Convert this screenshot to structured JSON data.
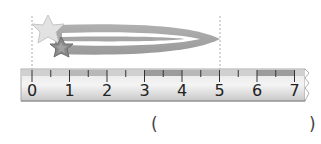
{
  "figure": {
    "object": "hair-clip-with-stars",
    "object_start": 0,
    "object_end": 5,
    "guide_lines": [
      0,
      5
    ]
  },
  "ruler": {
    "unit_spacing_px": 37.5,
    "origin_x": 32,
    "labels": [
      "0",
      "1",
      "2",
      "3",
      "4",
      "5",
      "6",
      "7"
    ],
    "band_colors": [
      "#d0d0d0",
      "#b8b8b8",
      "#d0d0d0",
      "#9c9c9c",
      "#b8b8b8",
      "#d0d0d0",
      "#9c9c9c",
      "#d0d0d0"
    ]
  },
  "answer": {
    "open_paren": "(",
    "close_paren": ")",
    "value": ""
  }
}
